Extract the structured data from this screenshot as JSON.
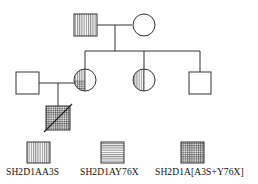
{
  "diagram": {
    "type": "pedigree",
    "top_text_cropped": "",
    "generations": [
      {
        "id": "I",
        "members": [
          {
            "id": "I-1",
            "sex": "male",
            "phenotype": "SH2D1AA3S"
          },
          {
            "id": "I-2",
            "sex": "female",
            "phenotype": "unaffected"
          }
        ]
      },
      {
        "id": "II",
        "members": [
          {
            "id": "II-1",
            "sex": "male",
            "phenotype": "unaffected",
            "note": "married-in spouse"
          },
          {
            "id": "II-2",
            "sex": "female",
            "phenotype": "carrier SH2D1AA3S and SH2D1AY76X (left half: vertical top, grid bottom)"
          },
          {
            "id": "II-3",
            "sex": "female",
            "phenotype": "carrier SH2D1AA3S (left half vertical)"
          },
          {
            "id": "II-4",
            "sex": "male",
            "phenotype": "unaffected"
          }
        ]
      },
      {
        "id": "III",
        "members": [
          {
            "id": "III-1",
            "sex": "male",
            "phenotype": "SH2D1A[A3S+Y76X]",
            "deceased": true
          }
        ]
      }
    ]
  },
  "legend": {
    "items": [
      {
        "pattern": "vertical",
        "label": "SH2D1AA3S"
      },
      {
        "pattern": "horizontal",
        "label": "SH2D1AY76X"
      },
      {
        "pattern": "grid",
        "label": "SH2D1A[A3S+Y76X]"
      }
    ]
  },
  "colors": {
    "line": "#333333",
    "background": "#ffffff"
  }
}
